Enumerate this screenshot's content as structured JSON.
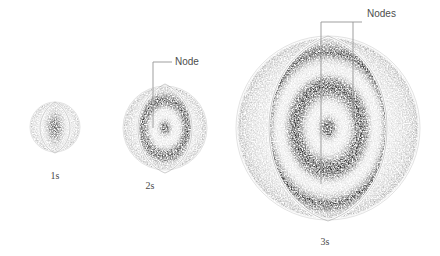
{
  "figure": {
    "background_color": "#ffffff",
    "ink_color": "#3a3a3a",
    "line_color": "#8d8d8d",
    "label_color": "#4a4a4a"
  },
  "orbitals": [
    {
      "id": "1s",
      "principal_number": "1",
      "subshell": "s",
      "label": "1s",
      "node_count": 0,
      "shell_count": 1,
      "center_x": 55,
      "center_y": 127,
      "radius": 25,
      "label_x": 55,
      "label_y": 172
    },
    {
      "id": "2s",
      "principal_number": "2",
      "subshell": "s",
      "label": "2s",
      "node_count": 1,
      "shell_count": 2,
      "center_x": 153,
      "center_y": 128,
      "radius": 42,
      "label_x": 150,
      "label_y": 182
    },
    {
      "id": "3s",
      "principal_number": "3",
      "subshell": "s",
      "label": "3s",
      "node_count": 2,
      "shell_count": 3,
      "center_x": 328,
      "center_y": 128,
      "radius": 92,
      "label_x": 325,
      "label_y": 238
    }
  ],
  "annotations": [
    {
      "id": "node-2s",
      "text": "Node",
      "target_orbital": "2s",
      "pointer_count": 1,
      "text_x": 175,
      "text_y": 62
    },
    {
      "id": "nodes-3s",
      "text": "Nodes",
      "target_orbital": "3s",
      "pointer_count": 2,
      "text_x": 367,
      "text_y": 12
    }
  ]
}
